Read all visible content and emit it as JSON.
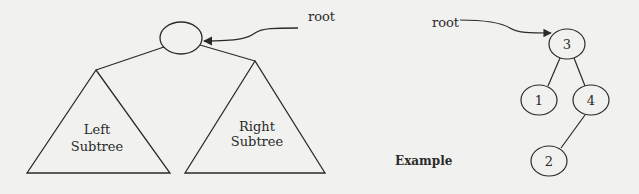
{
  "generic_tree": {
    "root_label": "root",
    "left_subtree": [
      "Left",
      "Subtree"
    ],
    "right_subtree": [
      "Right",
      "Subtree"
    ]
  },
  "example_tree": {
    "caption": "Example",
    "root_label": "root",
    "nodes": [
      {
        "id": "3",
        "label": "3"
      },
      {
        "id": "1",
        "label": "1"
      },
      {
        "id": "4",
        "label": "4"
      },
      {
        "id": "2",
        "label": "2"
      }
    ],
    "edges": [
      [
        "3",
        "1"
      ],
      [
        "3",
        "4"
      ],
      [
        "4",
        "2"
      ]
    ]
  },
  "colors": {
    "ink": "#2a2a2a",
    "paper": "#f1f1ef"
  }
}
